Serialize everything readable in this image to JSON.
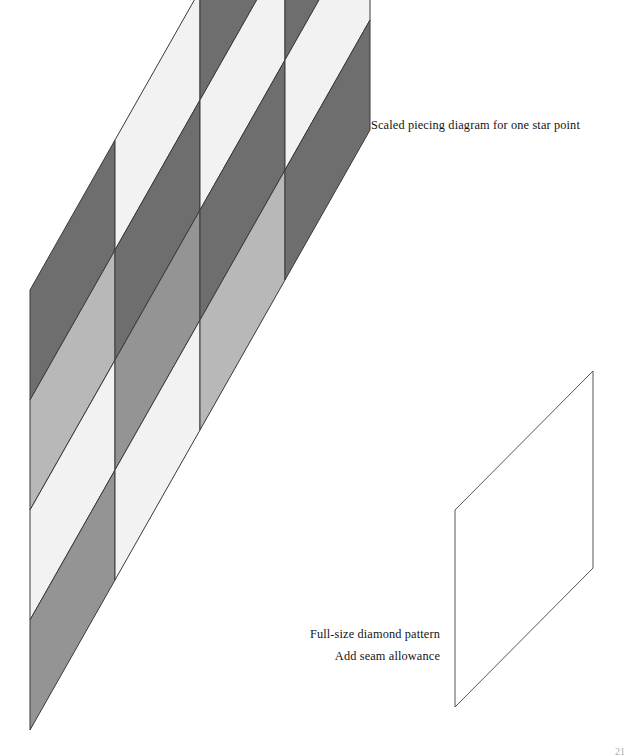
{
  "page": {
    "width": 627,
    "height": 755,
    "background": "#ffffff",
    "folio": "21"
  },
  "captions": {
    "scaled_diagram": "Scaled piecing diagram for one star point",
    "fullsize_lines": [
      "Full-size diamond pattern",
      "Add seam allowance"
    ]
  },
  "palette": {
    "dark": "#6e6e6e",
    "medium": "#949494",
    "light": "#b8b8b8",
    "white": "#f2f2f2",
    "outline": "#3a3a3a",
    "outline_thin": "#555555"
  },
  "scaled_diagram": {
    "name": "scaled-piecing-diagram",
    "description": "Four by four grid of slanted diamonds forming one star point",
    "columns": 4,
    "rows": 4,
    "cell_width": 85,
    "cell_height": 110,
    "column_rise": 150,
    "origin_x": 30,
    "origin_y": 290,
    "shade_grid": [
      [
        "dark",
        "white",
        "dark",
        "light"
      ],
      [
        "light",
        "dark",
        "white",
        "dark"
      ],
      [
        "white",
        "medium",
        "dark",
        "white"
      ],
      [
        "medium",
        "white",
        "light",
        "dark"
      ]
    ]
  },
  "fullsize_diamond": {
    "name": "full-size-diamond-pattern",
    "description": "Single outlined diamond template at full size",
    "points": "593,371 455,510 455,707 593,568",
    "stroke": "#555555",
    "stroke_width": 1,
    "fill": "#ffffff"
  }
}
